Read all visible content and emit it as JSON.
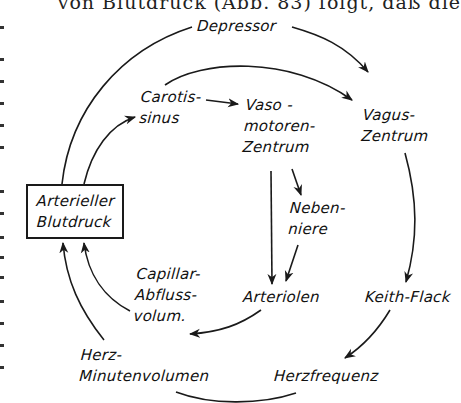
{
  "page_text": {
    "top_line": "von Blutdruck (Abb. 83) folgt, daß die"
  },
  "diagram": {
    "nodes": {
      "depressor": "Depressor",
      "carotissinus": "Carotis-\nsinus",
      "vasomotoren_zentrum": "Vaso -\nmotoren-\nZentrum",
      "vagus_zentrum": "Vagus-\nZentrum",
      "arterieller_blutdruck": "Arterieller\nBlutdruck",
      "nebenniere": "Neben-\nniere",
      "capillar_abfluss": "Capillar-\nAbfluss-\nvolum.",
      "arteriolen": "Arteriolen",
      "keith_flack": "Keith-Flack",
      "herz_minutenvolumen": "Herz-\nMinutenvolumen",
      "herzfrequenz": "Herzfrequenz"
    },
    "edges": [
      {
        "from": "Arterieller Blutdruck",
        "to": "Vagus-Zentrum",
        "via": "Depressor"
      },
      {
        "from": "Arterieller Blutdruck",
        "to": "Carotissinus"
      },
      {
        "from": "Carotissinus",
        "to": "Vasomotoren-Zentrum"
      },
      {
        "from": "Carotissinus",
        "to": "Vagus-Zentrum"
      },
      {
        "from": "Vasomotoren-Zentrum",
        "to": "Arteriolen"
      },
      {
        "from": "Vasomotoren-Zentrum",
        "to": "Nebenniere"
      },
      {
        "from": "Nebenniere",
        "to": "Arteriolen"
      },
      {
        "from": "Vagus-Zentrum",
        "to": "Keith-Flack"
      },
      {
        "from": "Keith-Flack",
        "to": "Herzfrequenz"
      },
      {
        "from": "Herzfrequenz",
        "to": "Herz-Minutenvolumen"
      },
      {
        "from": "Herz-Minutenvolumen",
        "to": "Arterieller Blutdruck"
      },
      {
        "from": "Arteriolen",
        "to": "Capillar-Abflussvolum."
      },
      {
        "from": "Capillar-Abflussvolum.",
        "to": "Arterieller Blutdruck"
      }
    ],
    "line_color": "#1a1a1a"
  }
}
